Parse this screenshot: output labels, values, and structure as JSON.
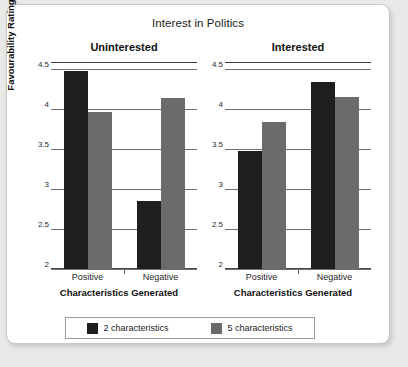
{
  "chart_data": {
    "type": "bar",
    "title": "Interest in Politics",
    "xlabel": "Characteristics Generated",
    "ylabel": "Favourability Rating",
    "ylim": [
      2,
      4.5
    ],
    "yticks": [
      "2",
      "2.5",
      "3",
      "3.5",
      "4",
      "4.5"
    ],
    "ytick_values": [
      2,
      2.5,
      3,
      3.5,
      4,
      4.5
    ],
    "grid": true,
    "legend_position": "bottom",
    "categories": [
      "Positive",
      "Negative"
    ],
    "panels": [
      {
        "name": "Uninterested",
        "xlabel": "Characteristics Generated",
        "series": [
          {
            "name": "2 characteristics",
            "color": "#1e1e1e",
            "values": [
              4.47,
              2.85
            ]
          },
          {
            "name": "5 characteristics",
            "color": "#6b6b6b",
            "values": [
              3.96,
              4.14
            ]
          }
        ]
      },
      {
        "name": "Interested",
        "xlabel": "Characteristics Generated",
        "series": [
          {
            "name": "2 characteristics",
            "color": "#1e1e1e",
            "values": [
              3.48,
              4.34
            ]
          },
          {
            "name": "5 characteristics",
            "color": "#6b6b6b",
            "values": [
              3.84,
              4.15
            ]
          }
        ]
      }
    ],
    "legend": [
      {
        "label": "2 characteristics",
        "color": "#1e1e1e"
      },
      {
        "label": "5 characteristics",
        "color": "#6b6b6b"
      }
    ]
  }
}
